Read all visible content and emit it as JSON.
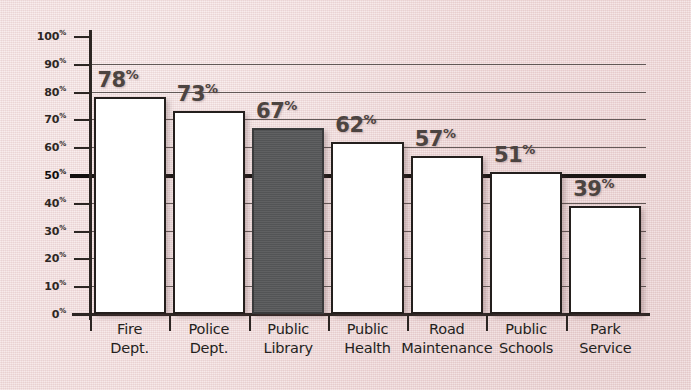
{
  "chart_data": {
    "type": "bar",
    "title": "",
    "xlabel": "",
    "ylabel": "",
    "ylim": [
      0,
      100
    ],
    "grid": true,
    "legend": "none",
    "value_suffix": "%",
    "highlight_category": "Public Library",
    "highlight_color": "#57585a",
    "bar_color": "#ffffff",
    "background_color": "#f2dcdc",
    "axis_color": "#2c2623",
    "emphasis_gridline": 50,
    "categories": [
      "Fire\nDept.",
      "Police\nDept.",
      "Public\nLibrary",
      "Public\nHealth",
      "Road\nMaintenance",
      "Public\nSchools",
      "Park\nService"
    ],
    "values": [
      78,
      73,
      67,
      62,
      57,
      51,
      39
    ],
    "value_labels": [
      "78",
      "73",
      "67",
      "62",
      "57",
      "51",
      "39"
    ],
    "ytick_values": [
      100,
      90,
      80,
      70,
      60,
      50,
      40,
      30,
      20,
      10,
      0
    ],
    "ytick_labels": [
      "100",
      "90",
      "80",
      "70",
      "60",
      "50",
      "40",
      "30",
      "20",
      "10",
      "0"
    ],
    "ytick_suffix": "%"
  }
}
